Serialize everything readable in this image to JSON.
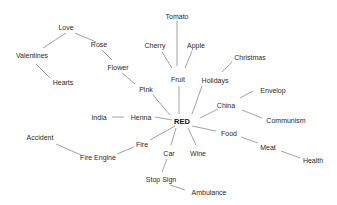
{
  "diagram": {
    "type": "mind-map",
    "center": {
      "label": "RED",
      "x": 182,
      "y": 122
    },
    "nodes": [
      {
        "id": "love",
        "label": "Love",
        "x": 66,
        "y": 27
      },
      {
        "id": "valentines",
        "label": "Valentines",
        "x": 32,
        "y": 55
      },
      {
        "id": "hearts",
        "label": "Hearts",
        "x": 63,
        "y": 82
      },
      {
        "id": "rose",
        "label": "Rose",
        "x": 99,
        "y": 44
      },
      {
        "id": "flower",
        "label": "Flower",
        "x": 118,
        "y": 67
      },
      {
        "id": "pink",
        "label": "Pink",
        "x": 146,
        "y": 89
      },
      {
        "id": "tomato",
        "label": "Tomato",
        "x": 177,
        "y": 16
      },
      {
        "id": "cherry",
        "label": "Cherry",
        "x": 155,
        "y": 45
      },
      {
        "id": "apple",
        "label": "Apple",
        "x": 196,
        "y": 45
      },
      {
        "id": "fruit",
        "label": "Fruit",
        "x": 178,
        "y": 79
      },
      {
        "id": "christmas",
        "label": "Christmas",
        "x": 250,
        "y": 57
      },
      {
        "id": "holidays",
        "label": "Holidays",
        "x": 215,
        "y": 80
      },
      {
        "id": "envelop",
        "label": "Envelop",
        "x": 273,
        "y": 90
      },
      {
        "id": "china",
        "label": "China",
        "x": 226,
        "y": 105
      },
      {
        "id": "communism",
        "label": "Communism",
        "x": 286,
        "y": 120
      },
      {
        "id": "food",
        "label": "Food",
        "x": 229,
        "y": 133
      },
      {
        "id": "meat",
        "label": "Meat",
        "x": 268,
        "y": 147
      },
      {
        "id": "health",
        "label": "Health",
        "x": 313,
        "y": 160
      },
      {
        "id": "wine",
        "label": "Wine",
        "x": 198,
        "y": 153
      },
      {
        "id": "car",
        "label": "Car",
        "x": 169,
        "y": 153
      },
      {
        "id": "stopsign",
        "label": "Stop Sign",
        "x": 161,
        "y": 179
      },
      {
        "id": "ambulance",
        "label": "Ambulance",
        "x": 209,
        "y": 192
      },
      {
        "id": "fire",
        "label": "Fire",
        "x": 142,
        "y": 144
      },
      {
        "id": "fireengine",
        "label": "Fire Engine",
        "x": 98,
        "y": 157
      },
      {
        "id": "accident",
        "label": "Accident",
        "x": 40,
        "y": 137
      },
      {
        "id": "henna",
        "label": "Henna",
        "x": 141,
        "y": 117
      },
      {
        "id": "india",
        "label": "India",
        "x": 99,
        "y": 117
      }
    ],
    "edges": [
      [
        66,
        33,
        43,
        48
      ],
      [
        75,
        33,
        96,
        42
      ],
      [
        36,
        64,
        50,
        78
      ],
      [
        102,
        50,
        112,
        60
      ],
      [
        122,
        73,
        135,
        84
      ],
      [
        153,
        95,
        170,
        115
      ],
      [
        177,
        21,
        177,
        66
      ],
      [
        162,
        52,
        172,
        68
      ],
      [
        192,
        51,
        185,
        68
      ],
      [
        179,
        86,
        179,
        114
      ],
      [
        232,
        62,
        222,
        72
      ],
      [
        202,
        86,
        192,
        114
      ],
      [
        253,
        91,
        240,
        98
      ],
      [
        200,
        118,
        218,
        109
      ],
      [
        242,
        110,
        262,
        118
      ],
      [
        192,
        126,
        216,
        131
      ],
      [
        241,
        137,
        258,
        143
      ],
      [
        281,
        151,
        300,
        158
      ],
      [
        188,
        128,
        196,
        145
      ],
      [
        176,
        128,
        171,
        145
      ],
      [
        167,
        159,
        162,
        172
      ],
      [
        170,
        185,
        185,
        190
      ],
      [
        175,
        126,
        150,
        140
      ],
      [
        134,
        147,
        117,
        154
      ],
      [
        81,
        155,
        56,
        144
      ],
      [
        155,
        117,
        172,
        120
      ],
      [
        112,
        117,
        124,
        117
      ]
    ]
  }
}
